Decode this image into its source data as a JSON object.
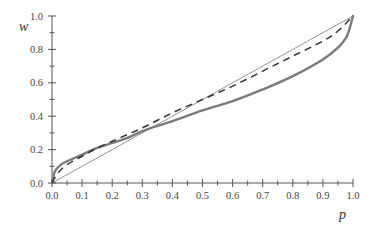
{
  "chart_data": {
    "type": "line",
    "title": "",
    "xlabel": "p",
    "ylabel": "w",
    "xlim": [
      0.0,
      1.0
    ],
    "ylim": [
      0.0,
      1.0
    ],
    "grid": false,
    "legend": null,
    "x_ticks": [
      "0.0",
      "0.1",
      "0.2",
      "0.3",
      "0.4",
      "0.5",
      "0.6",
      "0.7",
      "0.8",
      "0.9",
      "1.0"
    ],
    "y_ticks": [
      "0.0",
      "0.2",
      "0.4",
      "0.6",
      "0.8",
      "1.0"
    ],
    "series": [
      {
        "name": "identity",
        "style": "thin-solid",
        "color": "#888888",
        "x": [
          0.0,
          1.0
        ],
        "y": [
          0.0,
          1.0
        ]
      },
      {
        "name": "weighting-function-strong",
        "style": "thick-solid",
        "color": "#7a7a7a",
        "x": [
          0.0,
          0.01,
          0.03,
          0.05,
          0.1,
          0.15,
          0.2,
          0.25,
          0.3,
          0.33,
          0.4,
          0.5,
          0.6,
          0.7,
          0.8,
          0.9,
          0.95,
          0.98,
          1.0
        ],
        "y": [
          0.0,
          0.07,
          0.11,
          0.13,
          0.17,
          0.21,
          0.24,
          0.27,
          0.31,
          0.33,
          0.37,
          0.435,
          0.49,
          0.56,
          0.64,
          0.74,
          0.81,
          0.88,
          1.0
        ]
      },
      {
        "name": "weighting-function-mild",
        "style": "dashed",
        "color": "#333333",
        "x": [
          0.0,
          0.02,
          0.05,
          0.1,
          0.15,
          0.2,
          0.25,
          0.3,
          0.4,
          0.5,
          0.6,
          0.7,
          0.8,
          0.9,
          0.95,
          1.0
        ],
        "y": [
          0.0,
          0.06,
          0.11,
          0.16,
          0.21,
          0.25,
          0.29,
          0.33,
          0.42,
          0.5,
          0.58,
          0.67,
          0.76,
          0.85,
          0.91,
          1.0
        ]
      }
    ]
  },
  "axes": {
    "x_label": "p",
    "y_label": "w"
  }
}
